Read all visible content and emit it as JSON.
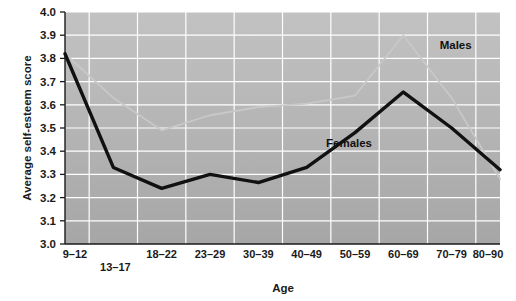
{
  "chart_data": {
    "type": "line",
    "title": "",
    "xlabel": "Age",
    "ylabel": "Average self-esteem score",
    "categories": [
      "9–12",
      "13–17",
      "18–22",
      "23–29",
      "30–39",
      "40–49",
      "50–59",
      "60–69",
      "70–79",
      "80–90"
    ],
    "ylim": [
      3.0,
      4.0
    ],
    "ytick_labels": [
      "3.0",
      "3.1",
      "3.2",
      "3.3",
      "3.4",
      "3.5",
      "3.6",
      "3.7",
      "3.8",
      "3.9",
      "4.0"
    ],
    "ytick_values": [
      3.0,
      3.1,
      3.2,
      3.3,
      3.4,
      3.5,
      3.6,
      3.7,
      3.8,
      3.9,
      4.0
    ],
    "grid": true,
    "legend_position": "inline-annotations",
    "series": [
      {
        "name": "Females",
        "color": "#111111",
        "values": [
          3.82,
          3.33,
          3.24,
          3.3,
          3.265,
          3.33,
          3.48,
          3.655,
          3.5,
          3.32
        ]
      },
      {
        "name": "Males",
        "color": "#c8c8c8",
        "values": [
          3.82,
          3.63,
          3.49,
          3.555,
          3.59,
          3.605,
          3.64,
          3.9,
          3.63,
          3.28
        ]
      }
    ],
    "annotations": [
      {
        "text": "Males",
        "x_category": "70–79",
        "value": 3.84
      },
      {
        "text": "Females",
        "x_category": "50–59",
        "value": 3.42
      }
    ],
    "plot_background": "#b4b4b4",
    "gridline_color": "#ffffff",
    "axis_color": "#1a1a1a"
  }
}
